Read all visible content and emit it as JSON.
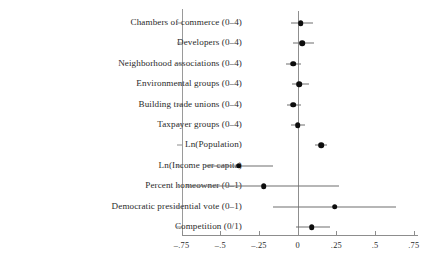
{
  "chart_data": {
    "type": "scatter",
    "subtype": "coefficient-plot",
    "title": "",
    "subtitle": "",
    "xlabel": "",
    "ylabel": "",
    "xlim": [
      -0.875,
      0.875
    ],
    "xticks": [
      -0.75,
      -0.5,
      -0.25,
      0,
      0.25,
      0.5,
      0.75
    ],
    "xticklabels": [
      "–.75",
      "–.5",
      "–.25",
      "0",
      ".25",
      ".5",
      ".75"
    ],
    "grid": false,
    "legend": null,
    "zero_reference_line": 0,
    "categories": [
      "Chambers of commerce (0–4)",
      "Developers (0–4)",
      "Neighborhood associations (0–4)",
      "Environmental groups (0–4)",
      "Building trade unions (0–4)",
      "Taxpayer groups (0–4)",
      "Ln(Population)",
      "Ln(Income per capita)",
      "Percent homeowner (0–1)",
      "Democratic presidential vote (0–1)",
      "Competition (0/1)"
    ],
    "values": [
      0.02,
      0.03,
      -0.03,
      0.01,
      -0.03,
      0.0,
      0.15,
      -0.38,
      -0.22,
      0.24,
      0.09
    ],
    "ci_low": [
      -0.045,
      -0.032,
      -0.075,
      -0.038,
      -0.072,
      -0.042,
      0.112,
      -0.6,
      -0.72,
      -0.162,
      -0.01
    ],
    "ci_high": [
      0.1,
      0.105,
      0.02,
      0.07,
      0.022,
      0.048,
      0.191,
      -0.158,
      0.268,
      0.635,
      0.21
    ],
    "points": [
      {
        "label": "Chambers of commerce (0–4)",
        "estimate": 0.02,
        "ci_low": -0.045,
        "ci_high": 0.1
      },
      {
        "label": "Developers (0–4)",
        "estimate": 0.03,
        "ci_low": -0.032,
        "ci_high": 0.105
      },
      {
        "label": "Neighborhood associations (0–4)",
        "estimate": -0.03,
        "ci_low": -0.075,
        "ci_high": 0.02
      },
      {
        "label": "Environmental groups (0–4)",
        "estimate": 0.01,
        "ci_low": -0.038,
        "ci_high": 0.07
      },
      {
        "label": "Building trade unions (0–4)",
        "estimate": -0.03,
        "ci_low": -0.072,
        "ci_high": 0.022
      },
      {
        "label": "Taxpayer groups (0–4)",
        "estimate": 0.0,
        "ci_low": -0.042,
        "ci_high": 0.048
      },
      {
        "label": "Ln(Population)",
        "estimate": 0.15,
        "ci_low": 0.112,
        "ci_high": 0.191
      },
      {
        "label": "Ln(Income per capita)",
        "estimate": -0.38,
        "ci_low": -0.6,
        "ci_high": -0.158
      },
      {
        "label": "Percent homeowner (0–1)",
        "estimate": -0.22,
        "ci_low": -0.72,
        "ci_high": 0.268
      },
      {
        "label": "Democratic presidential vote (0–1)",
        "estimate": 0.24,
        "ci_low": -0.162,
        "ci_high": 0.635
      },
      {
        "label": "Competition (0/1)",
        "estimate": 0.09,
        "ci_low": -0.01,
        "ci_high": 0.21
      }
    ],
    "colors": {
      "point": "#0d0d0d",
      "ci": "#6e6e6e",
      "axis": "#8d8d8d",
      "zero_line": "#8f8f8f",
      "text": "#2a2a2a",
      "background": "#ffffff"
    }
  },
  "layout": {
    "plot_left_px": 182,
    "plot_right_px": 418,
    "zero_x_px": 297.7,
    "px_per_unit": 154.8,
    "first_row_y_px": 23,
    "row_step_px": 20.4,
    "axis_y_px": 235
  }
}
